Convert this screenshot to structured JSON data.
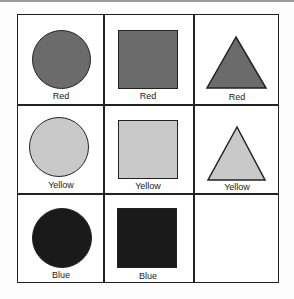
{
  "colors": {
    "red": "#6b6b6b",
    "yellow": "#c9c9c9",
    "blue": "#1a1a1a",
    "border": "#222222"
  },
  "grid": {
    "rows": 3,
    "cols": 3,
    "cells": [
      {
        "row": 0,
        "col": 0,
        "shape": "circle",
        "color": "red",
        "label": "Red"
      },
      {
        "row": 0,
        "col": 1,
        "shape": "square",
        "color": "red",
        "label": "Red"
      },
      {
        "row": 0,
        "col": 2,
        "shape": "triangle",
        "color": "red",
        "label": "Red"
      },
      {
        "row": 1,
        "col": 0,
        "shape": "circle",
        "color": "yellow",
        "label": "Yellow"
      },
      {
        "row": 1,
        "col": 1,
        "shape": "square",
        "color": "yellow",
        "label": "Yellow"
      },
      {
        "row": 1,
        "col": 2,
        "shape": "triangle",
        "color": "yellow",
        "label": "Yellow"
      },
      {
        "row": 2,
        "col": 0,
        "shape": "circle",
        "color": "blue",
        "label": "Blue"
      },
      {
        "row": 2,
        "col": 1,
        "shape": "square",
        "color": "blue",
        "label": "Blue"
      },
      {
        "row": 2,
        "col": 2,
        "shape": "empty",
        "color": null,
        "label": ""
      }
    ]
  }
}
